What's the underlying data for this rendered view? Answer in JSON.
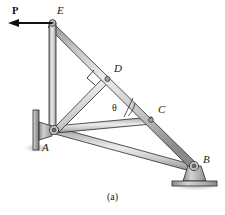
{
  "figure": {
    "caption": "(a)",
    "caption_x": 104,
    "caption_y": 194
  },
  "force": {
    "label": "P",
    "label_x": 12,
    "label_y": 12,
    "direction": "left",
    "arrow_tail_x": 52,
    "arrow_tail_y": 23,
    "arrow_head_x": 11,
    "arrow_head_y": 23
  },
  "angle": {
    "label": "θ",
    "label_x": 113,
    "label_y": 109,
    "description": "angle between member AC and diagonal EB at joint C"
  },
  "joints": [
    {
      "id": "A",
      "label": "A",
      "label_x": 44,
      "label_y": 147,
      "x": 56,
      "y": 131,
      "support": "pin-on-wall"
    },
    {
      "id": "B",
      "label": "B",
      "label_x": 203,
      "label_y": 160,
      "x": 194,
      "y": 168,
      "support": "pin-on-pedestal"
    },
    {
      "id": "C",
      "label": "C",
      "label_x": 159,
      "label_y": 110,
      "x": 151,
      "y": 122,
      "support": "none"
    },
    {
      "id": "D",
      "label": "D",
      "label_x": 115,
      "label_y": 68,
      "x": 107,
      "y": 79,
      "support": "none"
    },
    {
      "id": "E",
      "label": "E",
      "label_x": 57,
      "label_y": 8,
      "x": 53,
      "y": 23,
      "support": "pin"
    }
  ],
  "members": [
    {
      "id": "AE",
      "from": "A",
      "to": "E",
      "name": "vertical-column"
    },
    {
      "id": "EB",
      "from": "E",
      "to": "B",
      "name": "main-diagonal"
    },
    {
      "id": "AD",
      "from": "A",
      "to": "D",
      "name": "perpendicular-brace"
    },
    {
      "id": "AC",
      "from": "A",
      "to": "C",
      "name": "horizontal-tie"
    },
    {
      "id": "AB",
      "from": "A",
      "to": "B",
      "name": "bottom-chord"
    }
  ],
  "marks": {
    "right_angle_at": "D",
    "right_angle_note": "brace AD is perpendicular to diagonal EB"
  },
  "colors": {
    "member_fill_light": "#e8e8e8",
    "member_fill_mid": "#c9c9c9",
    "member_fill_dark": "#9a9a9a",
    "outline": "#2b2b2b",
    "support_fill": "#b4b4b4",
    "shadow": "#d7d7d7",
    "background": "#ffffff",
    "label_color": "#1a1a1a"
  }
}
